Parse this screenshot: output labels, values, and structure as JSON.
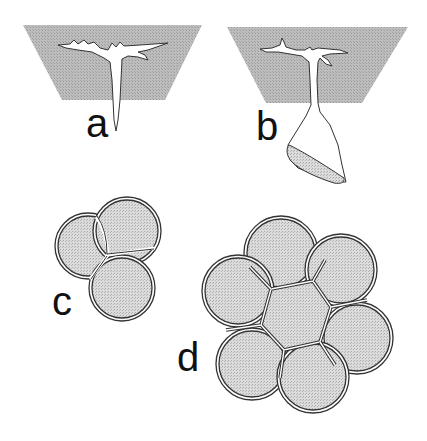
{
  "figure": {
    "panels": [
      {
        "id": "a",
        "label": "a",
        "description": "T-shaped branched cell embedded in tissue block, with narrow tapering extension below"
      },
      {
        "id": "b",
        "label": "b",
        "description": "Branched cell in tissue block with stalk ending in flattened sac below"
      },
      {
        "id": "c",
        "label": "c",
        "description": "Cluster of three double-walled round cells"
      },
      {
        "id": "d",
        "label": "d",
        "description": "Rosette of six double-walled round cells around a central hexagonal cell"
      }
    ]
  },
  "colors": {
    "tissue_fill": "#b8b8b8",
    "cell_fill": "#d6d6d6",
    "outline": "#333333",
    "background": "#ffffff"
  }
}
